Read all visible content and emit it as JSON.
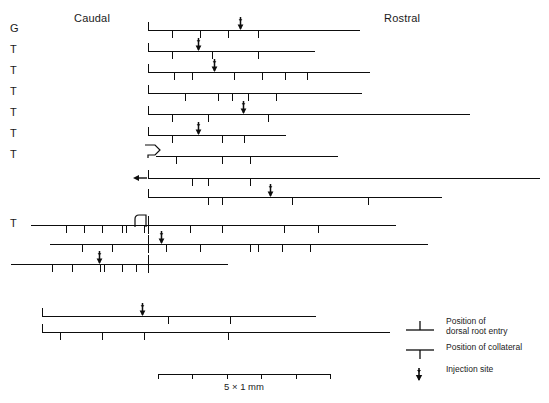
{
  "figure": {
    "headers": {
      "caudal": "Caudal",
      "rostral": "Rostral"
    },
    "origin_x": 148,
    "scale": {
      "label": "5 × 1 mm",
      "divisions": 5,
      "px_per_mm": 34.4,
      "start_x": 158,
      "end_x": 330
    },
    "legend": [
      {
        "icon": "dorsal-root-entry-icon",
        "text": "Position of\ndorsal root entry"
      },
      {
        "icon": "collateral-icon",
        "text": "Position of collateral"
      },
      {
        "icon": "injection-site-icon",
        "text": "Injection site"
      }
    ],
    "rows": [
      {
        "label": "G",
        "y": 30,
        "x1": 148,
        "x2": 360,
        "origin_marker": "dorsal-root-entry",
        "ticks": [
          172,
          200,
          228,
          258
        ],
        "injection": 240
      },
      {
        "label": "T",
        "y": 51,
        "x1": 148,
        "x2": 315,
        "origin_marker": "dorsal-root-entry",
        "ticks": [
          172,
          212,
          258
        ],
        "injection": 198
      },
      {
        "label": "T",
        "y": 72,
        "x1": 148,
        "x2": 370,
        "origin_marker": "dorsal-root-entry",
        "ticks": [
          174,
          192,
          234,
          262,
          285,
          307
        ],
        "injection": 214
      },
      {
        "label": "T",
        "y": 93,
        "x1": 148,
        "x2": 362,
        "origin_marker": "dorsal-root-entry",
        "ticks": [
          185,
          218,
          232,
          248,
          276
        ],
        "injection": null
      },
      {
        "label": "T",
        "y": 114,
        "x1": 148,
        "x2": 470,
        "origin_marker": "dorsal-root-entry",
        "ticks": [
          172,
          208,
          268
        ],
        "injection": 243
      },
      {
        "label": "T",
        "y": 135,
        "x1": 148,
        "x2": 286,
        "origin_marker": "dorsal-root-entry",
        "ticks": [
          172,
          222,
          244
        ],
        "injection": 198
      },
      {
        "label": "T",
        "y": 156,
        "x1": 156,
        "x2": 338,
        "origin_marker": "pentagon",
        "ticks": [
          176,
          222,
          250
        ],
        "injection": null
      },
      {
        "label": "",
        "y": 178,
        "x1": 148,
        "x2": 540,
        "origin_marker": "dorsal-root-entry",
        "left_arrow": true,
        "ticks": [
          192,
          208,
          250
        ],
        "injection": null
      },
      {
        "label": "",
        "y": 197,
        "x1": 148,
        "x2": 442,
        "origin_marker": "dorsal-root-entry",
        "ticks": [
          208,
          222,
          292,
          368
        ],
        "injection": 270
      },
      {
        "label": "T",
        "y": 225,
        "x1": 31,
        "x2": 396,
        "origin_marker": "hook",
        "entry_tick": 148,
        "ticks": [
          66,
          84,
          102,
          122,
          126,
          144,
          190,
          222,
          284,
          318
        ],
        "injection": null
      },
      {
        "label": "",
        "y": 244,
        "x1": 50,
        "x2": 428,
        "origin_marker": "none",
        "entry_tick": 148,
        "ticks": [
          82,
          112,
          166,
          200,
          250,
          258,
          282,
          310
        ],
        "injection": 161
      },
      {
        "label": "",
        "y": 264,
        "x1": 11,
        "x2": 228,
        "origin_marker": "none",
        "entry_tick": 148,
        "ticks": [
          52,
          72,
          100,
          104,
          122,
          136
        ],
        "injection": 99
      },
      {
        "label": "",
        "y": 316,
        "x1": 42,
        "x2": 316,
        "origin_marker": "dorsal-root-entry",
        "ticks": [
          168,
          230
        ],
        "injection": 142
      },
      {
        "label": "",
        "y": 332,
        "x1": 42,
        "x2": 390,
        "origin_marker": "dorsal-root-entry",
        "ticks": [
          60,
          102,
          144,
          228
        ],
        "injection": null
      }
    ]
  }
}
